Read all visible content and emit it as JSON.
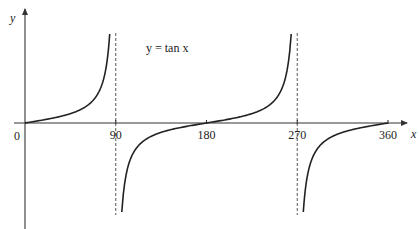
{
  "chart_data": {
    "type": "line",
    "title": "",
    "annotation": "y = tan x",
    "function": "tan",
    "xlabel": "x",
    "ylabel": "y",
    "origin_label": "0",
    "xlim": [
      0,
      360
    ],
    "ylim": [
      -9.5,
      9.5
    ],
    "x_ticks": [
      {
        "value": 90,
        "label": "90"
      },
      {
        "value": 180,
        "label": "180"
      },
      {
        "value": 270,
        "label": "270"
      },
      {
        "value": 360,
        "label": "360"
      }
    ],
    "asymptotes": [
      90,
      270
    ],
    "grid": false,
    "series": [
      {
        "name": "branch-1",
        "x_range": [
          0,
          84
        ]
      },
      {
        "name": "branch-2",
        "x_range": [
          96,
          264
        ]
      },
      {
        "name": "branch-3",
        "x_range": [
          276,
          360
        ]
      }
    ],
    "colors": {
      "curve": "#222222",
      "axis": "#333333",
      "asymptote": "#444444"
    }
  }
}
